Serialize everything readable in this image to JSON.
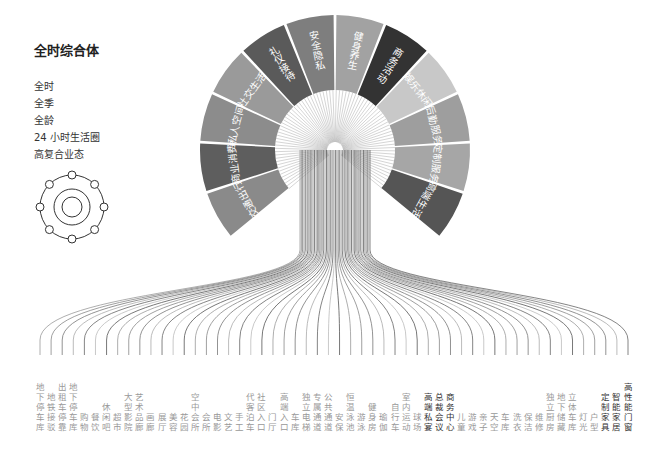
{
  "title": "全时综合体",
  "tags": [
    "全时",
    "全季",
    "全龄",
    "24 小时生活圈",
    "高复合业态"
  ],
  "icon": "orbit-diagram-icon",
  "fan_segments": [
    {
      "label": "交通出行",
      "color": "#8a8a8a"
    },
    {
      "label": "商业消费",
      "color": "#5e5e5e"
    },
    {
      "label": "私人空间",
      "color": "#8c8c8c"
    },
    {
      "label": "社交生活",
      "color": "#9a9a9a"
    },
    {
      "label": "礼仪接待",
      "color": "#5a5a5a"
    },
    {
      "label": "安全隐私",
      "color": "#7e7e7e"
    },
    {
      "label": "健身养生",
      "color": "#a2a2a2"
    },
    {
      "label": "商务活动",
      "color": "#333333"
    },
    {
      "label": "娱乐休闲",
      "color": "#c8c8c8"
    },
    {
      "label": "后勤服务",
      "color": "#9e9e9e"
    },
    {
      "label": "定制服务",
      "color": "#a6a6a6"
    },
    {
      "label": "高端生活",
      "color": "#555555"
    }
  ],
  "bottom_labels": [
    "地下停车库",
    "地铁接驳",
    "出租车停靠",
    "地下停车库",
    "购物",
    "餐饮",
    "休闲吧",
    "超市",
    "大型影院",
    "艺术品廊",
    "画廊",
    "展厅",
    "美容",
    "花园",
    "空中会所",
    "会所",
    "电影",
    "文艺",
    "手工",
    "代客泊车",
    "社区入口",
    "门厅",
    "高端入口",
    "车库",
    "独立电梯",
    "专属通道",
    "公共通道",
    "安保",
    "恒温泳池",
    "游泳",
    "健身房",
    "瑜伽",
    "自行车",
    "室内运动",
    "球场",
    "高端私宴",
    "总裁会议",
    "商务中心",
    "儿童",
    "游戏",
    "亲子",
    "天空",
    "车库",
    "洗衣",
    "保洁",
    "维修",
    "独立厨房",
    "地下储藏",
    "立体车库",
    "灯光",
    "户型",
    "定制家具",
    "智能家居",
    "高性能门窗"
  ]
}
